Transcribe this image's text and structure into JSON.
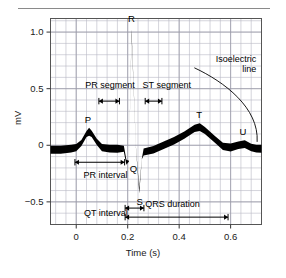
{
  "chart_data": {
    "type": "line",
    "title": "",
    "xlabel": "Time (s)",
    "ylabel": "mV",
    "xlim": [
      -0.1,
      0.72
    ],
    "ylim": [
      -0.7,
      1.12
    ],
    "grid": true,
    "legend": null,
    "x_ticks": [
      {
        "value": 0,
        "label": "0"
      },
      {
        "value": 0.2,
        "label": "0.2"
      },
      {
        "value": 0.4,
        "label": "0.4"
      },
      {
        "value": 0.6,
        "label": "0.6"
      }
    ],
    "y_ticks": [
      {
        "value": 1.0,
        "label": "1.0"
      },
      {
        "value": 0.5,
        "label": "0.5"
      },
      {
        "value": 0.0,
        "label": "0"
      },
      {
        "value": -0.5,
        "label": "−0.5"
      }
    ],
    "series": [
      {
        "name": "ECG trace (lead II)",
        "points": [
          [
            -0.1,
            -0.04
          ],
          [
            -0.06,
            -0.04
          ],
          [
            -0.02,
            -0.03
          ],
          [
            0.0,
            -0.02
          ],
          [
            0.02,
            0.02
          ],
          [
            0.04,
            0.1
          ],
          [
            0.05,
            0.12
          ],
          [
            0.06,
            0.1
          ],
          [
            0.08,
            0.03
          ],
          [
            0.1,
            -0.02
          ],
          [
            0.13,
            -0.03
          ],
          [
            0.16,
            -0.03
          ],
          [
            0.185,
            -0.03
          ],
          [
            0.195,
            -0.15
          ],
          [
            0.205,
            -0.14
          ],
          [
            0.215,
            1.0
          ],
          [
            0.232,
            -0.02
          ],
          [
            0.245,
            -0.4
          ],
          [
            0.255,
            -0.12
          ],
          [
            0.262,
            -0.06
          ],
          [
            0.3,
            -0.04
          ],
          [
            0.34,
            0.0
          ],
          [
            0.38,
            0.04
          ],
          [
            0.42,
            0.09
          ],
          [
            0.46,
            0.15
          ],
          [
            0.48,
            0.16
          ],
          [
            0.5,
            0.13
          ],
          [
            0.54,
            0.05
          ],
          [
            0.57,
            -0.01
          ],
          [
            0.6,
            -0.02
          ],
          [
            0.63,
            0.0
          ],
          [
            0.655,
            0.01
          ],
          [
            0.68,
            -0.02
          ],
          [
            0.7,
            -0.03
          ],
          [
            0.72,
            -0.03
          ]
        ],
        "band_half_width_mV": 0.035,
        "color": "#000000"
      }
    ],
    "wave_labels": [
      {
        "name": "P",
        "text": "P",
        "x": 0.045,
        "y": 0.22
      },
      {
        "name": "Q",
        "text": "Q",
        "x": 0.222,
        "y": -0.21
      },
      {
        "name": "R",
        "text": "R",
        "x": 0.215,
        "y": 1.12
      },
      {
        "name": "S",
        "text": "S",
        "x": 0.247,
        "y": -0.5
      },
      {
        "name": "T",
        "text": "T",
        "x": 0.478,
        "y": 0.27
      },
      {
        "name": "U",
        "text": "U",
        "x": 0.648,
        "y": 0.12
      }
    ],
    "annotations": [
      {
        "name": "pr-segment",
        "text": "PR segment",
        "measure_start_s": 0.088,
        "measure_end_s": 0.168,
        "arrow_y_mV": 0.39,
        "label_x_s": 0.035,
        "label_y_mV": 0.52
      },
      {
        "name": "st-segment",
        "text": "ST segment",
        "measure_start_s": 0.268,
        "measure_end_s": 0.333,
        "arrow_y_mV": 0.39,
        "label_x_s": 0.258,
        "label_y_mV": 0.52
      },
      {
        "name": "pr-interval",
        "text": "PR interval",
        "measure_start_s": -0.005,
        "measure_end_s": 0.188,
        "arrow_y_mV": -0.15,
        "label_x_s": 0.028,
        "label_y_mV": -0.27
      },
      {
        "name": "qrs-duration",
        "text": "QRS duration",
        "measure_start_s": 0.19,
        "measure_end_s": 0.263,
        "arrow_y_mV": -0.555,
        "label_x_s": 0.268,
        "label_y_mV": -0.525
      },
      {
        "name": "qt-interval",
        "text": "QT interval",
        "measure_start_s": 0.19,
        "measure_end_s": 0.59,
        "arrow_y_mV": -0.635,
        "label_x_s": 0.03,
        "label_y_mV": -0.605
      },
      {
        "name": "isoelectric-line",
        "text": "Isoelectric line",
        "text_line1": "Isoelectric",
        "text_line2": "line",
        "label_x_s": 0.7,
        "label_y_mV": 0.755,
        "pointer_to_x_s": 0.703,
        "pointer_to_y_mV": 0.03
      }
    ]
  },
  "figure": {
    "background": "#ffffff",
    "grid_color": "#b9b9c4",
    "frame_color": "#555555",
    "trace_color": "#000000",
    "text_color": "#000000"
  }
}
